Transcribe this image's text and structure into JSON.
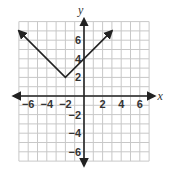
{
  "chart_data": {
    "type": "line",
    "title": "",
    "xlabel": "x",
    "ylabel": "y",
    "xlim": [
      -7,
      7
    ],
    "ylim": [
      -7,
      8
    ],
    "grid": true,
    "function": "y = |x + 2| + 2",
    "vertex": [
      -2,
      2
    ],
    "series": [
      {
        "name": "absolute value graph",
        "x": [
          -7,
          -2,
          3
        ],
        "y": [
          7,
          2,
          7
        ],
        "arrows_at_ends": true
      }
    ],
    "x_ticks": [
      {
        "value": -6,
        "label": "−6"
      },
      {
        "value": -4,
        "label": "−4"
      },
      {
        "value": -2,
        "label": "−2"
      },
      {
        "value": 2,
        "label": "2"
      },
      {
        "value": 4,
        "label": "4"
      },
      {
        "value": 6,
        "label": "6"
      }
    ],
    "y_ticks": [
      {
        "value": 6,
        "label": "6"
      },
      {
        "value": 4,
        "label": "4"
      },
      {
        "value": 2,
        "label": "2"
      },
      {
        "value": -2,
        "label": "−2"
      },
      {
        "value": -4,
        "label": "−4"
      },
      {
        "value": -6,
        "label": "−6"
      }
    ]
  },
  "colors": {
    "grid": "#c8c8c8",
    "axis": "#222222",
    "line": "#222222"
  }
}
